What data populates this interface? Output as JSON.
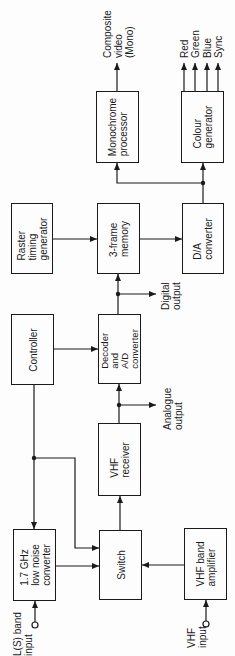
{
  "diagram": {
    "orientation": "rotated-90-ccw",
    "blocks": {
      "monochrome_processor": "Monochrome\nprocessor",
      "colour_generator": "Colour\ngenerator",
      "raster_timing_generator": "Raster\ntiming\ngenerator",
      "frame_memory": "3-frame\nmemory",
      "da_converter": "D/A\nconverter",
      "controller": "Controller",
      "decoder_ad": "Decoder\nand\nA/D\nconverter",
      "vhf_receiver": "VHF\nreceiver",
      "low_noise_converter": "1.7 GHz\nlow noise\nconverter",
      "switch": "Switch",
      "vhf_band_amplifier": "VHF band\namplifier"
    },
    "labels": {
      "composite_video": "Composite\nvideo\n(Mono)",
      "red": "Red",
      "green": "Green",
      "blue": "Blue",
      "sync": "Sync",
      "digital_output": "Digital\noutput",
      "analogue_output": "Analogue\noutput",
      "ls_band_input": "L(S) band\ninput",
      "vhf_input": "VHF\ninput"
    }
  }
}
